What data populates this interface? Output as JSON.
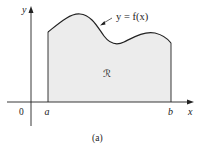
{
  "diagram": {
    "type": "area-under-curve",
    "curve_label": "y = f(x)",
    "region_label": "ℛ",
    "axes": {
      "x_label": "x",
      "y_label": "y",
      "origin_label": "0"
    },
    "bounds": {
      "left_label": "a",
      "right_label": "b"
    },
    "caption": "(a)",
    "colors": {
      "fill": "#ececec",
      "stroke": "#222222",
      "axis": "#222222"
    }
  }
}
